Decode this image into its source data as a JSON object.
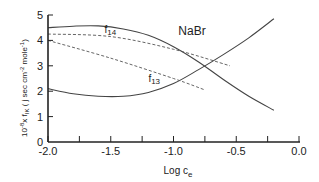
{
  "chart_data": {
    "type": "line",
    "title": "NaBr",
    "xlabel": "Log c_e",
    "xlabel_main": "Log c",
    "xlabel_sub": "e",
    "ylabel": "10^-8 x f_IK ( j sec cm^-2 mole^-1)",
    "ylabel_prefix": "10",
    "ylabel_exp": "-8",
    "ylabel_mid": "x f",
    "ylabel_sub": "IK",
    "ylabel_units": " ( j sec cm",
    "ylabel_units_exp": "-2",
    "ylabel_units_tail": " mole",
    "ylabel_units_exp2": "-1",
    "ylabel_close": ")",
    "xlim": [
      -2.0,
      0.0
    ],
    "ylim": [
      0,
      5
    ],
    "x_ticks": [
      -2.0,
      -1.75,
      -1.5,
      -1.25,
      -1.0,
      -0.75,
      -0.5,
      -0.25,
      0.0
    ],
    "x_tick_labels": [
      "-2.0",
      "-1.5",
      "-1.0",
      "-0.5",
      "0.0"
    ],
    "x_tick_label_values": [
      -2.0,
      -1.5,
      -1.0,
      -0.5,
      0.0
    ],
    "y_ticks": [
      0,
      1,
      2,
      3,
      4,
      5
    ],
    "y_tick_labels": [
      "0",
      "1",
      "2",
      "3",
      "4",
      "5"
    ],
    "grid": false,
    "legend": "none (inline curve labels)",
    "annotations": [
      {
        "text": "f14",
        "x": -1.55,
        "y": 4.3
      },
      {
        "text": "f13",
        "x": -1.2,
        "y": 2.35
      }
    ],
    "series": [
      {
        "name": "f14 (solid)",
        "style": "solid",
        "x": [
          -2.0,
          -1.8,
          -1.6,
          -1.4,
          -1.2,
          -1.0,
          -0.8,
          -0.6,
          -0.4,
          -0.2
        ],
        "y": [
          4.5,
          4.56,
          4.57,
          4.45,
          4.2,
          3.75,
          3.15,
          2.45,
          1.8,
          1.25
        ]
      },
      {
        "name": "f13 (solid)",
        "style": "solid",
        "x": [
          -2.0,
          -1.8,
          -1.6,
          -1.4,
          -1.2,
          -1.0,
          -0.8,
          -0.6,
          -0.4,
          -0.2
        ],
        "y": [
          2.1,
          1.9,
          1.8,
          1.8,
          1.95,
          2.3,
          2.85,
          3.45,
          4.1,
          4.85
        ]
      },
      {
        "name": "f14 (dashed)",
        "style": "dashed",
        "x": [
          -2.0,
          -1.5,
          -1.0,
          -0.55
        ],
        "y": [
          4.25,
          4.15,
          3.65,
          3.0
        ]
      },
      {
        "name": "f13 (dashed)",
        "style": "dashed",
        "x": [
          -2.0,
          -1.5,
          -1.0,
          -0.75
        ],
        "y": [
          4.0,
          3.3,
          2.5,
          2.05
        ]
      }
    ]
  }
}
